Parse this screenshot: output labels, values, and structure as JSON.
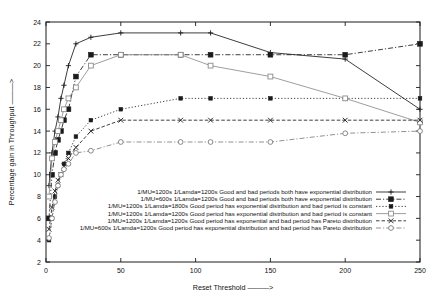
{
  "figure": {
    "background": "#ffffff",
    "axis_color": "#1b1b1b"
  },
  "chart_data": {
    "type": "line",
    "title": "",
    "xlabel": "Reset Threshold ———>",
    "ylabel": "Percentage gain in Throughput ———>",
    "xlim": [
      0,
      250
    ],
    "ylim": [
      2,
      24
    ],
    "xticks": [
      0,
      50,
      100,
      150,
      200,
      250
    ],
    "xtick_labels": [
      "0",
      "50",
      "100",
      "150",
      "200",
      "250"
    ],
    "yticks": [
      2,
      4,
      6,
      8,
      10,
      12,
      14,
      16,
      18,
      20,
      22,
      24
    ],
    "ytick_labels": [
      "2",
      "4",
      "6",
      "8",
      "10",
      "12",
      "14",
      "16",
      "18",
      "20",
      "22",
      "24"
    ],
    "grid": false,
    "legend_position": "lower-center-inside",
    "series": [
      {
        "name": "1/MU=1200s 1/Lamda=1200s Good and bad periods both have exponential distribution",
        "marker": "plus",
        "dash": "solid",
        "color": "#1b1b1b",
        "x": [
          2,
          4,
          6,
          8,
          10,
          12,
          15,
          20,
          30,
          50,
          90,
          110,
          150,
          200,
          250
        ],
        "y": [
          9.0,
          12.0,
          14.0,
          15.3,
          17.0,
          18.2,
          20.0,
          22.0,
          22.6,
          23.0,
          23.0,
          23.0,
          21.2,
          20.6,
          16.0
        ]
      },
      {
        "name": "1/MU=600s 1/Lamda=1200s Good and bad periods both have exponential distribution",
        "marker": "square-filled",
        "dash": "dashdot",
        "color": "#1b1b1b",
        "x": [
          2,
          4,
          6,
          8,
          10,
          12,
          15,
          20,
          30,
          50,
          90,
          110,
          150,
          200,
          250
        ],
        "y": [
          6.0,
          10.0,
          12.0,
          13.2,
          14.0,
          15.0,
          16.0,
          19.0,
          21.0,
          21.0,
          21.0,
          21.0,
          21.0,
          21.0,
          22.0
        ]
      },
      {
        "name": "1/MU=1200s 1/Lamda=1800s Good period has exponential distribution and bad period is constant",
        "marker": "square-filled-small",
        "dash": "dotted",
        "color": "#1b1b1b",
        "x": [
          2,
          4,
          6,
          8,
          10,
          12,
          15,
          20,
          30,
          50,
          90,
          110,
          150,
          200,
          250
        ],
        "y": [
          4.0,
          6.0,
          8.0,
          9.0,
          10.0,
          11.0,
          12.0,
          13.5,
          15.0,
          16.0,
          17.0,
          17.0,
          17.0,
          17.0,
          17.0
        ]
      },
      {
        "name": "1/MU=1200s 1/Lamda=1200s Good period has exponential distribution and bad period is constant",
        "marker": "square-open",
        "dash": "solid-light",
        "color": "#8c8c8c",
        "x": [
          2,
          4,
          6,
          8,
          10,
          12,
          15,
          20,
          30,
          50,
          90,
          110,
          150,
          200,
          250
        ],
        "y": [
          8.0,
          11.5,
          13.0,
          14.0,
          15.0,
          16.0,
          17.0,
          18.0,
          20.0,
          21.0,
          21.0,
          20.0,
          19.0,
          17.0,
          14.8
        ]
      },
      {
        "name": "1/MU=1200s 1/Lamda=1200s Good period has exponential and bad period has Pareto distribution",
        "marker": "x-cross",
        "dash": "dashed",
        "color": "#1b1b1b",
        "x": [
          2,
          4,
          6,
          8,
          10,
          12,
          15,
          20,
          30,
          50,
          90,
          110,
          150,
          200,
          250
        ],
        "y": [
          5.0,
          7.0,
          8.5,
          9.5,
          10.0,
          10.8,
          11.5,
          12.5,
          14.0,
          15.0,
          15.0,
          15.0,
          15.0,
          15.0,
          15.0
        ]
      },
      {
        "name": "1/MU=600s 1/Lamda=1200s Good period has exponential distribution and bad period has Pareto distribution",
        "marker": "circle-open",
        "dash": "dashdot-gray",
        "color": "#7d7d7d",
        "x": [
          2,
          4,
          6,
          8,
          10,
          12,
          15,
          20,
          30,
          50,
          90,
          110,
          150,
          200,
          250
        ],
        "y": [
          4.2,
          6.0,
          7.5,
          9.0,
          10.0,
          10.5,
          11.0,
          12.0,
          12.2,
          13.0,
          13.0,
          13.0,
          13.0,
          13.8,
          14.0
        ]
      }
    ]
  },
  "legend": {
    "entries": [
      "1/MU=1200s 1/Lamda=1200s Good and bad periods both have exponential distribution",
      "1/MU=600s 1/Lamda=1200s Good and bad periods both have exponential distribution",
      "1/MU=1200s 1/Lamda=1800s Good period has exponential distribution and bad period is constant",
      "1/MU=1200s 1/Lamda=1200s Good period has exponential distribution and bad period is constant",
      "1/MU=1200s 1/Lamda=1200s Good period has exponential and bad period has Pareto distribution",
      "1/MU=600s 1/Lamda=1200s Good period has exponential distribution and bad period has Pareto distribution"
    ]
  }
}
